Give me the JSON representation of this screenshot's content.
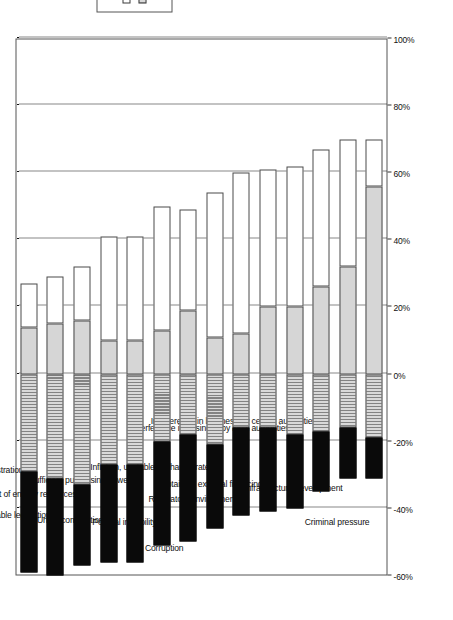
{
  "chart_data": {
    "type": "bar",
    "orientation": "horizontal-stacked-diverging",
    "title": "",
    "subtitle": "",
    "xlabel": "",
    "ylabel": "",
    "xlim": [
      -60,
      100
    ],
    "grid": true,
    "legend_position": "right",
    "axis_ticks": [
      "-60%",
      "-40%",
      "-20%",
      "0%",
      "20%",
      "40%",
      "60%",
      "80%",
      "100%"
    ],
    "axis_tick_values": [
      -60,
      -40,
      -20,
      0,
      20,
      40,
      60,
      80,
      100
    ],
    "categories": [
      "Tax rates and tax administration",
      "Unstable legislation",
      "Cost of energy resources",
      "Unfair competition",
      "Insufficient purchasing power",
      "Political instability",
      "Corruption",
      "Inflation, unstable exchange rate",
      "Regulatory environment",
      "Obtaining external financing",
      "Interference in business by local authorities",
      "Interference in business by central authorities",
      "Infrastructure development",
      "Criminal pressure"
    ],
    "series": [
      {
        "name": "Major Obstacle",
        "color": "#0a0a0a",
        "direction": "negative",
        "values": [
          30,
          29,
          24,
          29,
          29,
          31,
          32,
          25,
          26,
          25,
          22,
          18,
          15,
          12
        ]
      },
      {
        "name": "Significant Obstacle",
        "color": "#d9d9d9",
        "direction": "negative",
        "values": [
          29,
          31,
          33,
          27,
          27,
          20,
          18,
          21,
          16,
          16,
          18,
          17,
          16,
          19
        ]
      },
      {
        "name": "Minor Obstacle",
        "color": "#d6d6d6",
        "direction": "positive",
        "values": [
          14,
          15,
          16,
          10,
          10,
          13,
          19,
          11,
          12,
          20,
          20,
          26,
          32,
          56
        ]
      },
      {
        "name": "No Obstacle",
        "color": "#ffffff",
        "direction": "positive",
        "values": [
          13,
          14,
          16,
          31,
          31,
          37,
          30,
          43,
          48,
          41,
          42,
          41,
          38,
          14
        ]
      }
    ]
  },
  "legend": {
    "items": [
      {
        "label": "No Obstacle",
        "swatch": "sw-none"
      },
      {
        "label": "Significant Obstacle",
        "swatch": "sw-sig"
      },
      {
        "label": "Minor Obstacle",
        "swatch": "sw-minor"
      },
      {
        "label": "Major Obstacle",
        "swatch": "sw-major"
      }
    ]
  }
}
